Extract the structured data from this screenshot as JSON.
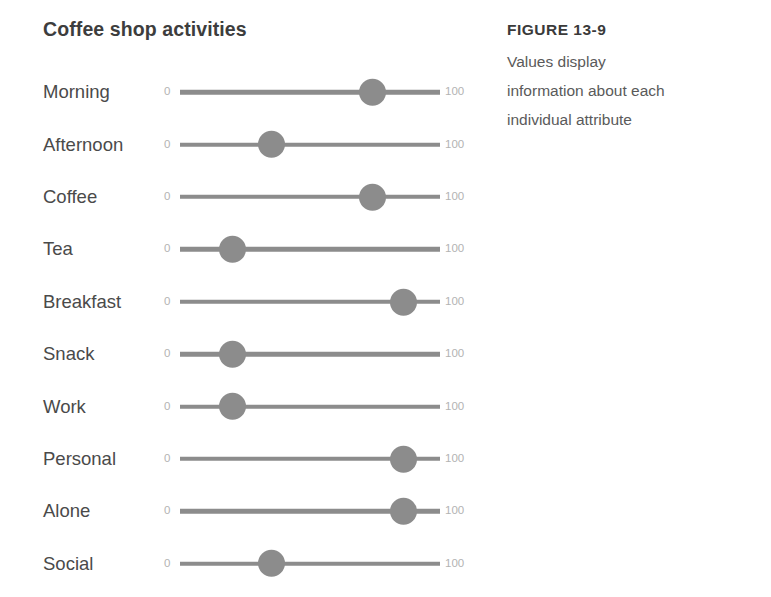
{
  "chart": {
    "title": "Coffee shop activities",
    "axis_min_label": "0",
    "axis_max_label": "100"
  },
  "caption": {
    "figure_number": "FIGURE 13-9",
    "line1": "Values display",
    "line2": "information about each",
    "line3": "individual attribute"
  },
  "colors": {
    "track": "#8c8c8c",
    "handle": "#8c8c8c",
    "title": "#3d3d3d",
    "label": "#4a4a4a",
    "axis_label": "#b3b3b3",
    "caption_heading": "#3a3a3a",
    "caption_body": "#5a5a5a",
    "background": "#ffffff"
  },
  "chart_data": {
    "type": "bar",
    "title": "Coffee shop activities",
    "subtitle": "",
    "xlabel": "",
    "ylabel": "",
    "xlim": [
      0,
      100
    ],
    "grid": false,
    "legend": "none",
    "tick_labels": [
      "0",
      "100"
    ],
    "categories": [
      "Morning",
      "Afternoon",
      "Coffee",
      "Tea",
      "Breakfast",
      "Snack",
      "Work",
      "Personal",
      "Alone",
      "Social"
    ],
    "values": [
      74,
      35,
      74,
      20,
      86,
      20,
      20,
      86,
      86,
      35
    ],
    "rows": [
      {
        "label": "Morning",
        "value": 74,
        "min": 0,
        "max": 100
      },
      {
        "label": "Afternoon",
        "value": 35,
        "min": 0,
        "max": 100
      },
      {
        "label": "Coffee",
        "value": 74,
        "min": 0,
        "max": 100
      },
      {
        "label": "Tea",
        "value": 20,
        "min": 0,
        "max": 100
      },
      {
        "label": "Breakfast",
        "value": 86,
        "min": 0,
        "max": 100
      },
      {
        "label": "Snack",
        "value": 20,
        "min": 0,
        "max": 100
      },
      {
        "label": "Work",
        "value": 20,
        "min": 0,
        "max": 100
      },
      {
        "label": "Personal",
        "value": 86,
        "min": 0,
        "max": 100
      },
      {
        "label": "Alone",
        "value": 86,
        "min": 0,
        "max": 100
      },
      {
        "label": "Social",
        "value": 35,
        "min": 0,
        "max": 100
      }
    ]
  }
}
